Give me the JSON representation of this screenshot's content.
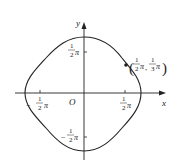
{
  "diagram": {
    "type": "closed curve on coordinate axes",
    "axes": {
      "x_label": "x",
      "y_label": "y",
      "origin_label": "O"
    },
    "ticks": {
      "x_pos": {
        "num": "1",
        "den": "2",
        "suffix": "π"
      },
      "x_neg": {
        "sign": "−",
        "num": "1",
        "den": "2",
        "suffix": "π"
      },
      "y_pos": {
        "num": "1",
        "den": "2",
        "suffix": "π"
      },
      "y_neg": {
        "sign": "−",
        "num": "1",
        "den": "2",
        "suffix": "π"
      }
    },
    "point": {
      "label_open": "(",
      "x_num": "1",
      "x_den": "2",
      "x_suffix": "π",
      "sep": ",",
      "y_num": "1",
      "y_den": "3",
      "y_suffix": "π",
      "label_close": ")"
    },
    "colors": {
      "stroke": "#222222",
      "background": "#ffffff"
    }
  }
}
